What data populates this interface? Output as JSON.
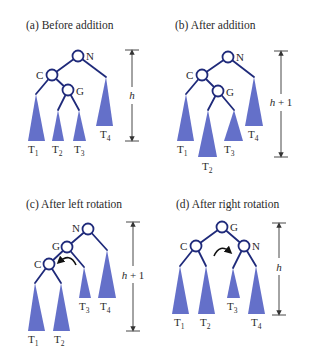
{
  "colors": {
    "edge": "#1f2a7a",
    "subtree_fill": "#6470c9",
    "text": "#2a2a2a",
    "background": "#ffffff"
  },
  "panels": [
    {
      "id": "a",
      "title": "(a) Before addition",
      "height_label": {
        "var": "h",
        "suffix": ""
      },
      "nodes": [
        {
          "label": "N"
        },
        {
          "label": "C"
        },
        {
          "label": "G"
        }
      ],
      "subtrees": [
        {
          "base": "T",
          "sub": "1"
        },
        {
          "base": "T",
          "sub": "2"
        },
        {
          "base": "T",
          "sub": "3"
        },
        {
          "base": "T",
          "sub": "4"
        }
      ]
    },
    {
      "id": "b",
      "title": "(b) After addition",
      "height_label": {
        "var": "h",
        "suffix": " + 1"
      },
      "nodes": [
        {
          "label": "N"
        },
        {
          "label": "C"
        },
        {
          "label": "G"
        }
      ],
      "subtrees": [
        {
          "base": "T",
          "sub": "1"
        },
        {
          "base": "T",
          "sub": "2"
        },
        {
          "base": "T",
          "sub": "3"
        },
        {
          "base": "T",
          "sub": "4"
        }
      ]
    },
    {
      "id": "c",
      "title": "(c) After left rotation",
      "height_label": {
        "var": "h",
        "suffix": " + 1"
      },
      "nodes": [
        {
          "label": "N"
        },
        {
          "label": "G"
        },
        {
          "label": "C"
        }
      ],
      "subtrees": [
        {
          "base": "T",
          "sub": "1"
        },
        {
          "base": "T",
          "sub": "2"
        },
        {
          "base": "T",
          "sub": "3"
        },
        {
          "base": "T",
          "sub": "4"
        }
      ],
      "rotation": "counterclockwise"
    },
    {
      "id": "d",
      "title": "(d) After right rotation",
      "height_label": {
        "var": "h",
        "suffix": ""
      },
      "nodes": [
        {
          "label": "G"
        },
        {
          "label": "C"
        },
        {
          "label": "N"
        }
      ],
      "subtrees": [
        {
          "base": "T",
          "sub": "1"
        },
        {
          "base": "T",
          "sub": "2"
        },
        {
          "base": "T",
          "sub": "3"
        },
        {
          "base": "T",
          "sub": "4"
        }
      ],
      "rotation": "clockwise"
    }
  ]
}
